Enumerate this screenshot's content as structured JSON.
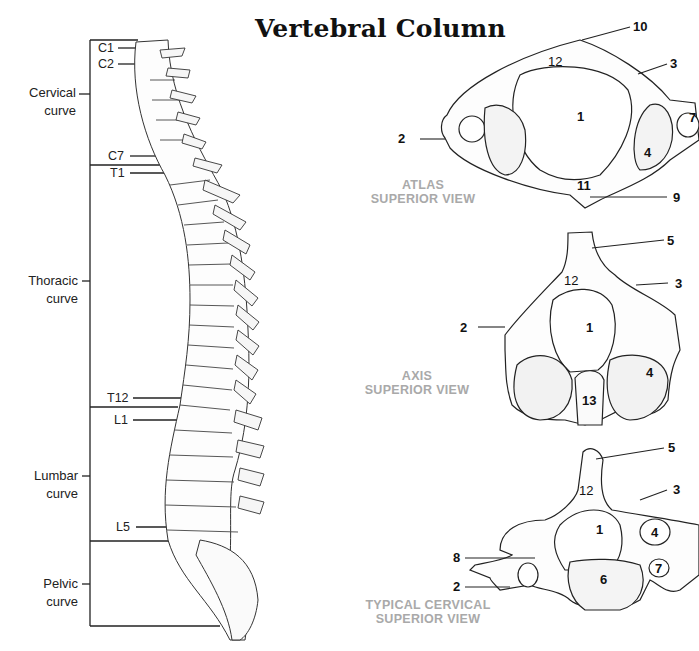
{
  "title": "Vertebral Column",
  "spine": {
    "vertebra_labels": [
      {
        "id": "c1",
        "text": "C1"
      },
      {
        "id": "c2",
        "text": "C2"
      },
      {
        "id": "c7",
        "text": "C7"
      },
      {
        "id": "t1",
        "text": "T1"
      },
      {
        "id": "t12",
        "text": "T12"
      },
      {
        "id": "l1",
        "text": "L1"
      },
      {
        "id": "l5",
        "text": "L5"
      }
    ],
    "curves": [
      {
        "id": "cervical",
        "line1": "Cervical",
        "line2": "curve"
      },
      {
        "id": "thoracic",
        "line1": "Thoracic",
        "line2": "curve"
      },
      {
        "id": "lumbar",
        "line1": "Lumbar",
        "line2": "curve"
      },
      {
        "id": "pelvic",
        "line1": "Pelvic",
        "line2": "curve"
      }
    ]
  },
  "views": {
    "atlas": {
      "caption_line1": "ATLAS",
      "caption_line2": "SUPERIOR VIEW",
      "callouts": [
        "10",
        "12",
        "3",
        "1",
        "2",
        "7",
        "4",
        "11",
        "9"
      ]
    },
    "axis": {
      "caption_line1": "AXIS",
      "caption_line2": "SUPERIOR VIEW",
      "callouts": [
        "5",
        "12",
        "3",
        "1",
        "2",
        "4",
        "13"
      ]
    },
    "typical_cervical": {
      "caption_line1": "TYPICAL CERVICAL",
      "caption_line2": "SUPERIOR VIEW",
      "callouts": [
        "5",
        "12",
        "3",
        "1",
        "4",
        "8",
        "7",
        "2",
        "6"
      ]
    }
  }
}
